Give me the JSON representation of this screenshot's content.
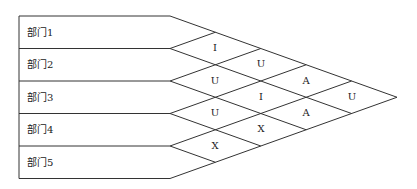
{
  "diagram": {
    "type": "relationship-matrix",
    "departments": [
      "部门1",
      "部门2",
      "部门3",
      "部门4",
      "部门5"
    ],
    "relationships": [
      {
        "pair": [
          "部门1",
          "部门2"
        ],
        "code": "I"
      },
      {
        "pair": [
          "部门2",
          "部门3"
        ],
        "code": "U"
      },
      {
        "pair": [
          "部门3",
          "部门4"
        ],
        "code": "U"
      },
      {
        "pair": [
          "部门4",
          "部门5"
        ],
        "code": "X"
      },
      {
        "pair": [
          "部门1",
          "部门3"
        ],
        "code": "U"
      },
      {
        "pair": [
          "部门2",
          "部门4"
        ],
        "code": "I"
      },
      {
        "pair": [
          "部门3",
          "部门5"
        ],
        "code": "X"
      },
      {
        "pair": [
          "部门1",
          "部门4"
        ],
        "code": "A"
      },
      {
        "pair": [
          "部门2",
          "部门5"
        ],
        "code": "A"
      },
      {
        "pair": [
          "部门1",
          "部门5"
        ],
        "code": "U"
      }
    ],
    "line_color": "#333333"
  }
}
